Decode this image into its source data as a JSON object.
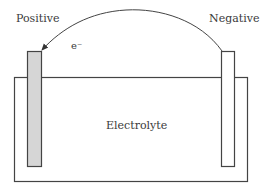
{
  "diagram": {
    "positive_label": "Positive",
    "negative_label": "Negative",
    "electron_label": "e⁻",
    "electrolyte_label": "Electrolyte",
    "colors": {
      "stroke": "#444444",
      "positive_fill": "#d6d6d6",
      "negative_fill": "#ffffff",
      "background": "#ffffff"
    }
  }
}
